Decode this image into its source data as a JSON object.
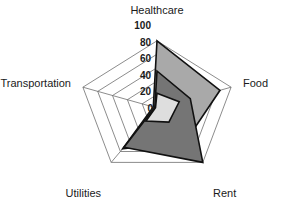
{
  "chart_data": {
    "type": "radar",
    "title": "",
    "categories": [
      "Healthcare",
      "Food",
      "Rent",
      "Utilities",
      "Transportation"
    ],
    "tick_labels": [
      "0",
      "20",
      "40",
      "60",
      "80",
      "100"
    ],
    "tick_values": [
      0,
      20,
      40,
      60,
      80,
      100
    ],
    "rlim": [
      0,
      100
    ],
    "grid": true,
    "legend": "none",
    "tick_axis": "Healthcare",
    "series": [
      {
        "name": "series-1",
        "color": "#a9a9a9",
        "values": [
          100,
          85,
          62,
          75,
          5
        ]
      },
      {
        "name": "series-2",
        "color": "#757575",
        "values": [
          55,
          45,
          100,
          72,
          3
        ]
      },
      {
        "name": "series-3",
        "color": "#dedede",
        "values": [
          22,
          30,
          26,
          24,
          2
        ]
      }
    ]
  },
  "labels": {
    "healthcare": "Healthcare",
    "food": "Food",
    "rent": "Rent",
    "utilities": "Utilities",
    "transportation": "Transportation"
  },
  "ticks": {
    "t100": "100",
    "t80": "80",
    "t60": "60",
    "t40": "40",
    "t20": "20",
    "t0": "0"
  },
  "colors": {
    "series_1": "#a9a9a9",
    "series_2": "#757575",
    "series_3": "#dedede",
    "outline": "#111111",
    "grid": "#6e6e6e",
    "text": "#1a1a1a",
    "background": "#ffffff"
  }
}
